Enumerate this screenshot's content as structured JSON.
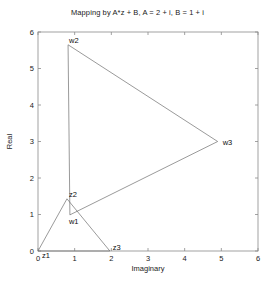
{
  "chart_data": {
    "type": "line",
    "title": "Mapping by A*z + B, A = 2 + i, B = 1 + i",
    "xlabel": "Imaginary",
    "ylabel": "Real",
    "xlim": [
      0,
      6
    ],
    "ylim": [
      0,
      6
    ],
    "xticks": [
      "0",
      "1",
      "2",
      "3",
      "4",
      "5",
      "6"
    ],
    "yticks": [
      "0",
      "1",
      "2",
      "3",
      "4",
      "5",
      "6"
    ],
    "grid": false,
    "legend": "none",
    "series": [
      {
        "name": "z-triangle",
        "points": [
          {
            "label": "z1",
            "x": 0.0,
            "y": 0.0
          },
          {
            "label": "z2",
            "x": 0.79,
            "y": 1.43
          },
          {
            "label": "z3",
            "x": 1.96,
            "y": 0.0
          }
        ],
        "closed": true
      },
      {
        "name": "w-triangle",
        "points": [
          {
            "label": "w1",
            "x": 0.87,
            "y": 0.99
          },
          {
            "label": "w2",
            "x": 0.82,
            "y": 5.65
          },
          {
            "label": "w3",
            "x": 4.9,
            "y": 3.0
          }
        ],
        "closed": true
      }
    ],
    "annotations": [
      {
        "label": "z1",
        "x": 0.0,
        "y": 0.0,
        "dx": 4,
        "dy": 7
      },
      {
        "label": "z2",
        "x": 0.79,
        "y": 1.43,
        "dx": 2,
        "dy": -2
      },
      {
        "label": "z3",
        "x": 1.96,
        "y": 0.0,
        "dx": 3,
        "dy": -1
      },
      {
        "label": "w1",
        "x": 0.87,
        "y": 0.99,
        "dx": -1,
        "dy": 9
      },
      {
        "label": "w2",
        "x": 0.82,
        "y": 5.65,
        "dx": 1,
        "dy": -2
      },
      {
        "label": "w3",
        "x": 4.9,
        "y": 3.0,
        "dx": 5,
        "dy": 3
      }
    ]
  },
  "figure": {
    "title": "Mapping by A*z + B, A = 2 + i, B = 1 + i",
    "xlabel": "Imaginary",
    "ylabel": "Real"
  },
  "colors": {
    "line": "#6e6e6e",
    "axis": "#8a8a8a",
    "text": "#1a1a1a",
    "background": "#ffffff"
  }
}
